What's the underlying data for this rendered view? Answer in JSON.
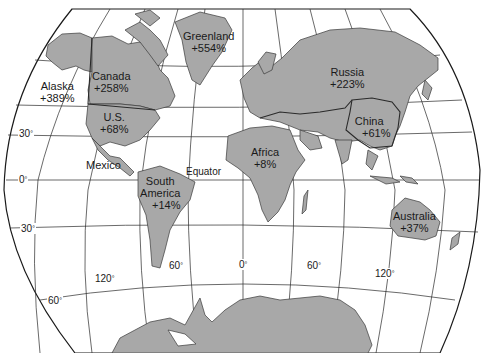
{
  "map": {
    "projection": "world map, rounded pseudo-cylindrical",
    "land_color": "#a8a8a8",
    "line_color": "#2a2a2a",
    "background": "#ffffff",
    "regions": [
      {
        "name": "Greenland",
        "value": "+554%"
      },
      {
        "name": "Canada",
        "value": "+258%"
      },
      {
        "name": "Alaska",
        "value": "+389%"
      },
      {
        "name": "U.S.",
        "value": "+68%"
      },
      {
        "name": "Mexico",
        "value": ""
      },
      {
        "name": "South America",
        "line1": "South",
        "line2": "America",
        "value": "+14%"
      },
      {
        "name": "Africa",
        "value": "+8%"
      },
      {
        "name": "Russia",
        "value": "+223%"
      },
      {
        "name": "China",
        "value": "+61%"
      },
      {
        "name": "Australia",
        "value": "+37%"
      }
    ],
    "annotations": {
      "equator": "Equator"
    },
    "latitude_labels": [
      "30",
      "0",
      "30",
      "60"
    ],
    "longitude_labels": [
      "120",
      "60",
      "0",
      "60",
      "120"
    ],
    "degree_symbol": "°"
  }
}
